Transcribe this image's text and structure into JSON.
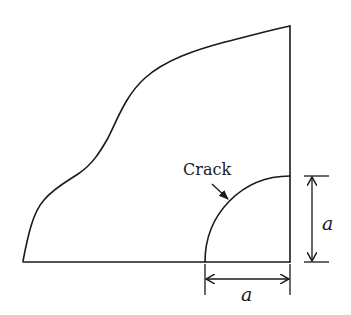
{
  "diagram": {
    "crack_label": "Crack",
    "dimension_vertical_label": "a",
    "dimension_horizontal_label": "a",
    "colors": {
      "line": "#1a1a1a",
      "background": "#ffffff"
    }
  }
}
